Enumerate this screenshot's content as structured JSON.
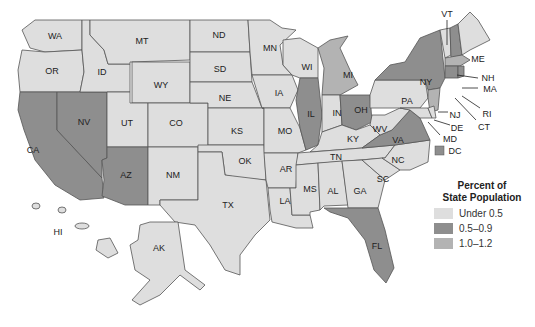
{
  "map": {
    "type": "choropleth",
    "region": "United States",
    "colors": {
      "light": "#dedede",
      "dark": "#8e8e8e",
      "medium": "#b3b3b3",
      "stroke": "#555555"
    },
    "states": [
      {
        "abbr": "WA",
        "category": "light"
      },
      {
        "abbr": "OR",
        "category": "light"
      },
      {
        "abbr": "CA",
        "category": "dark"
      },
      {
        "abbr": "NV",
        "category": "dark"
      },
      {
        "abbr": "ID",
        "category": "light"
      },
      {
        "abbr": "MT",
        "category": "light"
      },
      {
        "abbr": "WY",
        "category": "light"
      },
      {
        "abbr": "UT",
        "category": "light"
      },
      {
        "abbr": "AZ",
        "category": "dark"
      },
      {
        "abbr": "CO",
        "category": "light"
      },
      {
        "abbr": "NM",
        "category": "light"
      },
      {
        "abbr": "ND",
        "category": "light"
      },
      {
        "abbr": "SD",
        "category": "light"
      },
      {
        "abbr": "NE",
        "category": "light"
      },
      {
        "abbr": "KS",
        "category": "light"
      },
      {
        "abbr": "OK",
        "category": "light"
      },
      {
        "abbr": "TX",
        "category": "light"
      },
      {
        "abbr": "MN",
        "category": "light"
      },
      {
        "abbr": "IA",
        "category": "light"
      },
      {
        "abbr": "MO",
        "category": "light"
      },
      {
        "abbr": "AR",
        "category": "light"
      },
      {
        "abbr": "LA",
        "category": "light"
      },
      {
        "abbr": "WI",
        "category": "light"
      },
      {
        "abbr": "IL",
        "category": "dark"
      },
      {
        "abbr": "MI",
        "category": "medium"
      },
      {
        "abbr": "IN",
        "category": "light"
      },
      {
        "abbr": "OH",
        "category": "dark"
      },
      {
        "abbr": "KY",
        "category": "light"
      },
      {
        "abbr": "TN",
        "category": "light"
      },
      {
        "abbr": "MS",
        "category": "light"
      },
      {
        "abbr": "AL",
        "category": "light"
      },
      {
        "abbr": "GA",
        "category": "light"
      },
      {
        "abbr": "FL",
        "category": "dark"
      },
      {
        "abbr": "SC",
        "category": "light"
      },
      {
        "abbr": "NC",
        "category": "light"
      },
      {
        "abbr": "VA",
        "category": "dark"
      },
      {
        "abbr": "WV",
        "category": "light"
      },
      {
        "abbr": "PA",
        "category": "light"
      },
      {
        "abbr": "NY",
        "category": "dark"
      },
      {
        "abbr": "VT",
        "category": "light"
      },
      {
        "abbr": "NH",
        "category": "dark"
      },
      {
        "abbr": "ME",
        "category": "light"
      },
      {
        "abbr": "MA",
        "category": "medium"
      },
      {
        "abbr": "RI",
        "category": "dark"
      },
      {
        "abbr": "CT",
        "category": "dark"
      },
      {
        "abbr": "NJ",
        "category": "medium"
      },
      {
        "abbr": "DE",
        "category": "light"
      },
      {
        "abbr": "MD",
        "category": "light"
      },
      {
        "abbr": "DC",
        "category": "dark"
      },
      {
        "abbr": "AK",
        "category": "light"
      },
      {
        "abbr": "HI",
        "category": "light"
      }
    ]
  },
  "labels": {
    "WA": "WA",
    "OR": "OR",
    "CA": "CA",
    "NV": "NV",
    "ID": "ID",
    "MT": "MT",
    "WY": "WY",
    "UT": "UT",
    "AZ": "AZ",
    "CO": "CO",
    "NM": "NM",
    "ND": "ND",
    "SD": "SD",
    "NE": "NE",
    "KS": "KS",
    "OK": "OK",
    "TX": "TX",
    "MN": "MN",
    "IA": "IA",
    "MO": "MO",
    "AR": "AR",
    "LA": "LA",
    "WI": "WI",
    "IL": "IL",
    "MI": "MI",
    "IN": "IN",
    "OH": "OH",
    "KY": "KY",
    "TN": "TN",
    "MS": "MS",
    "AL": "AL",
    "GA": "GA",
    "FL": "FL",
    "SC": "SC",
    "NC": "NC",
    "VA": "VA",
    "WV": "WV",
    "PA": "PA",
    "NY": "NY",
    "VT": "VT",
    "NH": "NH",
    "ME": "ME",
    "MA": "MA",
    "RI": "RI",
    "CT": "CT",
    "NJ": "NJ",
    "DE": "DE",
    "MD": "MD",
    "DC": "DC",
    "AK": "AK",
    "HI": "HI"
  },
  "legend": {
    "title_line1": "Percent of",
    "title_line2": "State Population",
    "items": [
      {
        "label": "Under 0.5",
        "color": "#dedede"
      },
      {
        "label": "0.5–0.9",
        "color": "#8e8e8e"
      },
      {
        "label": "1.0–1.2",
        "color": "#b3b3b3"
      }
    ]
  }
}
